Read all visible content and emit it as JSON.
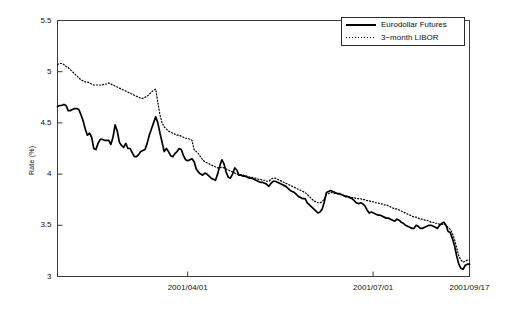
{
  "chart_data": {
    "type": "line",
    "title": "",
    "xlabel": "",
    "ylabel": "Rate (%)",
    "ylim": [
      3,
      5.5
    ],
    "yticks": [
      "3",
      "3.5",
      "4",
      "4.5",
      "5",
      "5.5"
    ],
    "ytick_values": [
      3,
      3.5,
      4,
      4.5,
      5,
      5.5
    ],
    "xticks": [
      "2001/04/01",
      "2001/07/01",
      "2001/09/17"
    ],
    "xtick_positions": [
      0.316,
      0.766,
      1.0
    ],
    "xlim_labels": [
      "",
      "2001/09/17"
    ],
    "grid": false,
    "legend_position": "top-right",
    "legend": [
      "Eurodollar Futures",
      "3−month LIBOR"
    ],
    "series": [
      {
        "name": "Eurodollar Futures",
        "style": "solid",
        "color": "#000000",
        "values": [
          4.66,
          4.67,
          4.67,
          4.68,
          4.67,
          4.62,
          4.62,
          4.63,
          4.64,
          4.64,
          4.63,
          4.58,
          4.52,
          4.44,
          4.38,
          4.4,
          4.36,
          4.25,
          4.24,
          4.3,
          4.34,
          4.34,
          4.33,
          4.33,
          4.33,
          4.29,
          4.36,
          4.48,
          4.42,
          4.31,
          4.28,
          4.26,
          4.3,
          4.25,
          4.25,
          4.21,
          4.17,
          4.17,
          4.19,
          4.22,
          4.23,
          4.24,
          4.3,
          4.38,
          4.44,
          4.5,
          4.56,
          4.5,
          4.4,
          4.31,
          4.22,
          4.25,
          4.22,
          4.18,
          4.17,
          4.2,
          4.22,
          4.25,
          4.24,
          4.18,
          4.14,
          4.13,
          4.14,
          4.15,
          4.12,
          4.05,
          4.02,
          4.0,
          3.99,
          4.01,
          4.0,
          3.98,
          3.96,
          3.95,
          3.94,
          4.0,
          4.08,
          4.14,
          4.1,
          4.02,
          3.97,
          3.96,
          4.0,
          4.06,
          4.04,
          3.99,
          3.99,
          3.98,
          3.98,
          3.97,
          3.96,
          3.96,
          3.95,
          3.94,
          3.93,
          3.92,
          3.92,
          3.91,
          3.9,
          3.88,
          3.91,
          3.93,
          3.93,
          3.92,
          3.91,
          3.9,
          3.89,
          3.88,
          3.86,
          3.84,
          3.83,
          3.82,
          3.8,
          3.78,
          3.77,
          3.76,
          3.76,
          3.72,
          3.7,
          3.68,
          3.66,
          3.64,
          3.62,
          3.63,
          3.66,
          3.73,
          3.82,
          3.83,
          3.84,
          3.83,
          3.82,
          3.81,
          3.81,
          3.8,
          3.79,
          3.78,
          3.78,
          3.77,
          3.76,
          3.74,
          3.72,
          3.71,
          3.72,
          3.71,
          3.69,
          3.65,
          3.62,
          3.63,
          3.62,
          3.61,
          3.6,
          3.6,
          3.59,
          3.58,
          3.57,
          3.57,
          3.56,
          3.55,
          3.54,
          3.56,
          3.55,
          3.53,
          3.52,
          3.5,
          3.49,
          3.48,
          3.47,
          3.47,
          3.5,
          3.49,
          3.47,
          3.47,
          3.48,
          3.49,
          3.5,
          3.5,
          3.49,
          3.48,
          3.47,
          3.5,
          3.52,
          3.53,
          3.5,
          3.44,
          3.43,
          3.37,
          3.3,
          3.2,
          3.12,
          3.08,
          3.07,
          3.11,
          3.12,
          3.12
        ]
      },
      {
        "name": "3−month LIBOR",
        "style": "dotted",
        "color": "#000000",
        "values": [
          5.07,
          5.08,
          5.08,
          5.07,
          5.05,
          5.04,
          5.02,
          5.0,
          4.98,
          4.96,
          4.94,
          4.92,
          4.91,
          4.9,
          4.9,
          4.89,
          4.88,
          4.87,
          4.87,
          4.87,
          4.87,
          4.87,
          4.88,
          4.88,
          4.89,
          4.88,
          4.87,
          4.86,
          4.85,
          4.84,
          4.83,
          4.82,
          4.81,
          4.8,
          4.79,
          4.78,
          4.77,
          4.76,
          4.75,
          4.74,
          4.74,
          4.75,
          4.76,
          4.78,
          4.8,
          4.82,
          4.83,
          4.7,
          4.58,
          4.5,
          4.46,
          4.44,
          4.42,
          4.41,
          4.4,
          4.39,
          4.38,
          4.38,
          4.37,
          4.36,
          4.35,
          4.35,
          4.34,
          4.33,
          4.24,
          4.22,
          4.2,
          4.17,
          4.14,
          4.12,
          4.11,
          4.1,
          4.09,
          4.08,
          4.07,
          4.06,
          4.06,
          4.07,
          4.06,
          4.05,
          4.04,
          4.03,
          4.02,
          4.01,
          4.0,
          4.0,
          3.99,
          3.99,
          3.98,
          3.98,
          3.97,
          3.97,
          3.96,
          3.96,
          3.95,
          3.95,
          3.94,
          3.94,
          3.93,
          3.93,
          3.95,
          3.96,
          3.96,
          3.95,
          3.94,
          3.93,
          3.92,
          3.91,
          3.9,
          3.89,
          3.88,
          3.87,
          3.86,
          3.85,
          3.84,
          3.83,
          3.82,
          3.8,
          3.78,
          3.76,
          3.74,
          3.73,
          3.72,
          3.72,
          3.73,
          3.76,
          3.8,
          3.81,
          3.82,
          3.82,
          3.81,
          3.81,
          3.8,
          3.8,
          3.79,
          3.79,
          3.78,
          3.78,
          3.77,
          3.77,
          3.76,
          3.76,
          3.76,
          3.75,
          3.75,
          3.74,
          3.74,
          3.73,
          3.73,
          3.72,
          3.72,
          3.71,
          3.71,
          3.7,
          3.7,
          3.69,
          3.68,
          3.67,
          3.66,
          3.66,
          3.65,
          3.64,
          3.63,
          3.62,
          3.61,
          3.6,
          3.59,
          3.58,
          3.58,
          3.57,
          3.56,
          3.56,
          3.55,
          3.55,
          3.54,
          3.53,
          3.53,
          3.52,
          3.52,
          3.51,
          3.51,
          3.51,
          3.5,
          3.48,
          3.46,
          3.42,
          3.36,
          3.28,
          3.2,
          3.16,
          3.14,
          3.15,
          3.16,
          3.16
        ]
      }
    ]
  }
}
